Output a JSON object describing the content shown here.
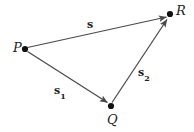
{
  "figure": {
    "width": 194,
    "height": 132,
    "background_color": "#ffffff",
    "stroke_color": "#4a4a4a",
    "dot_color": "#111111",
    "text_color": "#242424"
  },
  "points": [
    {
      "name": "P",
      "label": "P",
      "x": 25,
      "y": 49,
      "label_x": 13,
      "label_y": 41
    },
    {
      "name": "Q",
      "label": "Q",
      "x": 111,
      "y": 106,
      "label_x": 107,
      "label_y": 113
    },
    {
      "name": "R",
      "label": "R",
      "x": 170,
      "y": 14,
      "label_x": 176,
      "label_y": 4
    }
  ],
  "vectors": [
    {
      "name": "s",
      "label_main": "s",
      "label_sub": "",
      "from": "P",
      "to": "R",
      "label_x": 87,
      "label_y": 19
    },
    {
      "name": "s1",
      "label_main": "s",
      "label_sub": "1",
      "from": "P",
      "to": "Q",
      "label_x": 54,
      "label_y": 85
    },
    {
      "name": "s2",
      "label_main": "s",
      "label_sub": "2",
      "from": "Q",
      "to": "R",
      "label_x": 138,
      "label_y": 67
    }
  ]
}
